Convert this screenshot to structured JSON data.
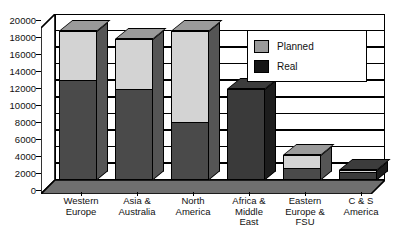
{
  "chart_data": {
    "type": "bar",
    "subtype": "stacked-3d-column",
    "title": "",
    "xlabel": "",
    "ylabel": "",
    "ylim": [
      0,
      20000
    ],
    "ytick_step": 2000,
    "yticks": [
      "20000",
      "18000",
      "16000",
      "14000",
      "12000",
      "10000",
      "8000",
      "6000",
      "4000",
      "2000",
      "0"
    ],
    "grid": true,
    "grid_axis": "y",
    "legend_position": "top-right-inside",
    "categories": [
      "Western Europe",
      "Asia & Australia",
      "North America",
      "Africa & Middle East",
      "Eastern Europe & FSU",
      "C & S America"
    ],
    "category_lines": [
      [
        "Western",
        "Europe"
      ],
      [
        "Asia &",
        "Australia"
      ],
      [
        "North",
        "America"
      ],
      [
        "Africa &",
        "Middle",
        "East"
      ],
      [
        "Eastern",
        "Europe &",
        "FSU"
      ],
      [
        "C & S",
        "America"
      ]
    ],
    "series": [
      {
        "name": "Planned",
        "color": "#d3d3d3",
        "values": [
          18000,
          17000,
          18000,
          11000,
          3000,
          1200
        ]
      },
      {
        "name": "Real",
        "color": "#1d1d1d",
        "values": [
          12000,
          11000,
          7000,
          11000,
          1500,
          1000
        ]
      }
    ]
  },
  "legend": {
    "items": [
      {
        "label": "Planned",
        "swatch": "#9a9a9a"
      },
      {
        "label": "Real",
        "swatch": "#161616"
      }
    ]
  }
}
